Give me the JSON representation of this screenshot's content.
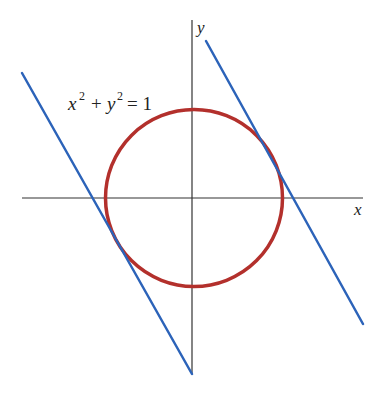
{
  "figure": {
    "equation": {
      "x_var": "x",
      "x_exp": "2",
      "plus": "+",
      "y_var": "y",
      "y_exp": "2",
      "equals": "= 1"
    },
    "axes": {
      "x_label": "x",
      "y_label": "y"
    },
    "colors": {
      "circle": "#b3302c",
      "tangent_lines": "#2c63b9",
      "axes": "#333333"
    }
  }
}
